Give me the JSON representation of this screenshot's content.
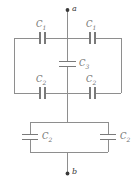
{
  "diagram": {
    "colors": {
      "background": "#ffffff",
      "wire": "#8e8e8e",
      "plate": "#7a7a7a",
      "label": "#6e6e6e",
      "terminal": "#3a3a3a"
    },
    "terminals": [
      {
        "id": "terminal-a",
        "label": "a",
        "position": "top"
      },
      {
        "id": "terminal-b",
        "label": "b",
        "position": "bottom"
      }
    ],
    "components": [
      {
        "id": "cap-top-left",
        "label": "C",
        "subscript": "1",
        "orientation": "horizontal",
        "branch": "upper-left"
      },
      {
        "id": "cap-top-right",
        "label": "C",
        "subscript": "1",
        "orientation": "horizontal",
        "branch": "upper-right"
      },
      {
        "id": "cap-bridge-center",
        "label": "C",
        "subscript": "3",
        "orientation": "vertical",
        "branch": "bridge"
      },
      {
        "id": "cap-middle-left",
        "label": "C",
        "subscript": "2",
        "orientation": "horizontal",
        "branch": "lower-left"
      },
      {
        "id": "cap-middle-right",
        "label": "C",
        "subscript": "2",
        "orientation": "horizontal",
        "branch": "lower-right"
      },
      {
        "id": "cap-bottom-left",
        "label": "C",
        "subscript": "2",
        "orientation": "vertical",
        "branch": "parallel-left"
      },
      {
        "id": "cap-bottom-right",
        "label": "C",
        "subscript": "2",
        "orientation": "vertical",
        "branch": "parallel-right"
      }
    ]
  }
}
